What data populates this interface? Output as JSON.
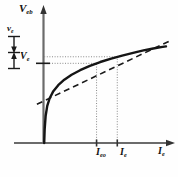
{
  "figure": {
    "kind": "line",
    "background_color": "#fefefe",
    "ink_color": "#111111",
    "axis_color": "#555555",
    "guide_color": "#777777"
  },
  "labels": {
    "y_axis": "V",
    "y_axis_sub": "eb",
    "x_axis": "I",
    "x_axis_sub": "e",
    "small_signal_voltage": "v",
    "small_signal_voltage_sub": "e",
    "bias_voltage": "V",
    "bias_voltage_sub": "e",
    "quiescent_current": "I",
    "quiescent_current_sub": "eo",
    "total_current": "I",
    "total_current_sub": "e"
  },
  "chart_data": {
    "type": "line",
    "title": "",
    "xlabel": "Ie",
    "ylabel": "Veb",
    "grid": false,
    "legend": null,
    "xlim": [
      0,
      1
    ],
    "ylim": [
      0,
      1
    ],
    "series": [
      {
        "name": "emitter junction characteristic",
        "style": "solid",
        "linewidth": 2.4,
        "x": [
          0.0,
          0.004,
          0.012,
          0.025,
          0.045,
          0.075,
          0.115,
          0.165,
          0.225,
          0.295,
          0.375,
          0.46,
          0.55,
          0.64,
          0.73,
          0.815,
          0.895,
          0.96,
          1.0
        ],
        "y": [
          0.0,
          0.13,
          0.25,
          0.34,
          0.41,
          0.475,
          0.53,
          0.58,
          0.625,
          0.667,
          0.706,
          0.742,
          0.773,
          0.801,
          0.826,
          0.848,
          0.866,
          0.878,
          0.885
        ]
      },
      {
        "name": "tangent at operating point",
        "style": "dashed",
        "linewidth": 1.6,
        "x": [
          -0.06,
          1.03
        ],
        "y": [
          0.355,
          0.935
        ]
      }
    ],
    "markers": {
      "operating_point": {
        "x": 0.43,
        "y": 0.73,
        "label": "Ieo"
      },
      "signal_point": {
        "x": 0.6,
        "y": 0.79,
        "label": "Ie"
      }
    },
    "guides": [
      {
        "type": "horizontal-dotted",
        "y": 0.79,
        "from_x": 0.0,
        "to_x": 0.6,
        "label": null
      },
      {
        "type": "horizontal-dotted",
        "y": 0.73,
        "from_x": 0.0,
        "to_x": 0.43,
        "label": "Ve"
      },
      {
        "type": "vertical-dotted",
        "x": 0.43,
        "from_y": 0.0,
        "to_y": 0.73,
        "label": "Ieo"
      },
      {
        "type": "vertical-dotted",
        "x": 0.6,
        "from_y": 0.0,
        "to_y": 0.79,
        "label": "Ie"
      }
    ],
    "annotations": [
      {
        "type": "double-arrow-vertical",
        "label": "ve",
        "meaning": "small-signal emitter voltage swing"
      },
      {
        "type": "tick",
        "axis": "y",
        "label": "Ve",
        "meaning": "quiescent emitter-base bias voltage"
      }
    ]
  }
}
